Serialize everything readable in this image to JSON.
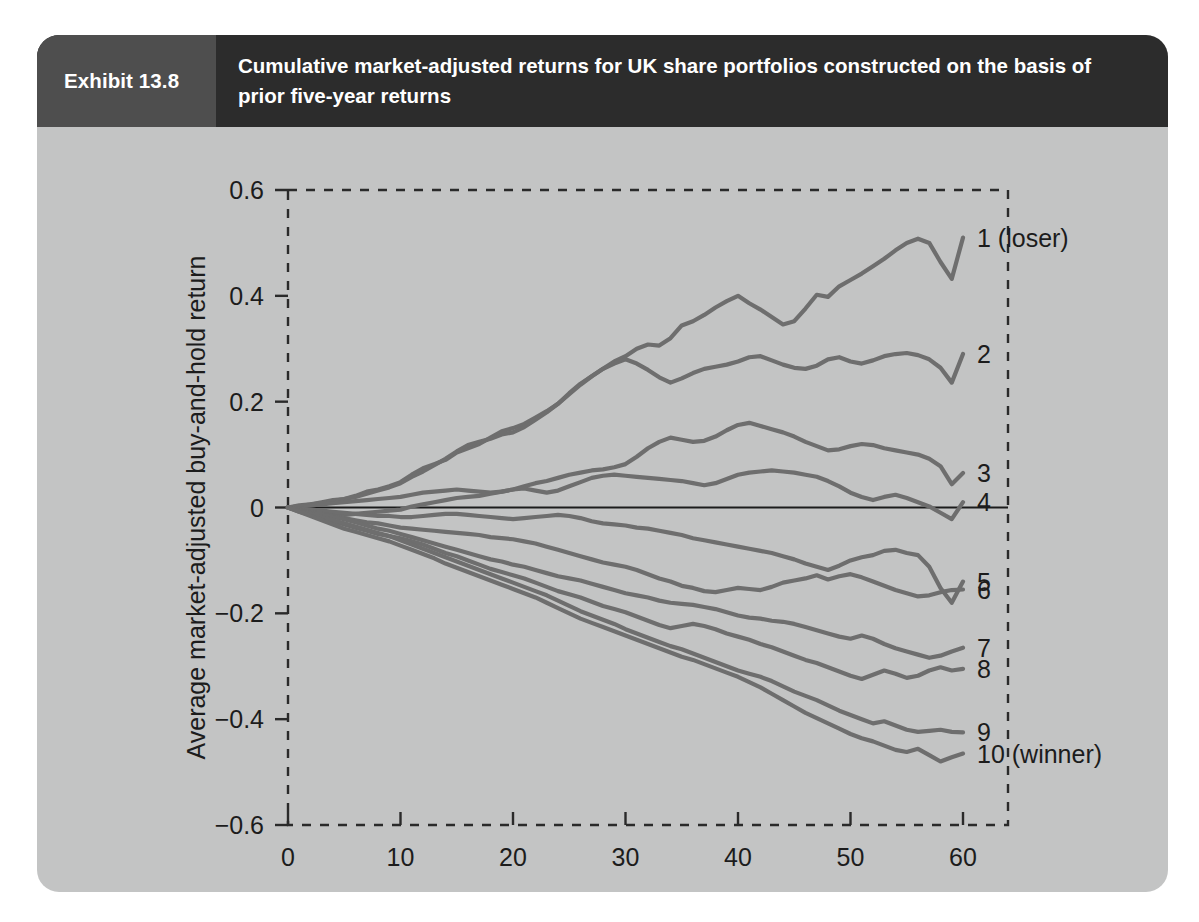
{
  "exhibit": {
    "tag": "Exhibit 13.8",
    "title": "Cumulative market-adjusted returns for UK share portfolios constructed on the basis of prior five-year returns"
  },
  "colors": {
    "card_background": "#c3c4c4",
    "header_title_background": "#2c2c2c",
    "header_tag_background": "#4e4e4e",
    "line_color": "#6e6e6e",
    "axis_color": "#2a2a2a",
    "text_color": "#1c1c1c"
  },
  "chart_data": {
    "type": "line",
    "title": "Cumulative market-adjusted returns for UK share portfolios constructed on the basis of prior five-year returns",
    "xlabel": "Months since portfolio formation",
    "ylabel": "Average market-adjusted buy-and-hold return",
    "xlim": [
      0,
      64
    ],
    "ylim": [
      -0.6,
      0.6
    ],
    "xticks": [
      0,
      10,
      20,
      30,
      40,
      50,
      60
    ],
    "xticklabels": [
      "0",
      "10",
      "20",
      "30",
      "40",
      "50",
      "60"
    ],
    "yticks": [
      -0.6,
      -0.4,
      -0.2,
      0,
      0.2,
      0.4,
      0.6
    ],
    "yticklabels": [
      "−0.6",
      "−0.4",
      "−0.2",
      "0",
      "0.2",
      "0.4",
      "0.6"
    ],
    "grid": false,
    "legend_position": "right-end-of-line",
    "zero_reference_line": 0,
    "x": [
      0,
      1,
      2,
      3,
      4,
      5,
      6,
      7,
      8,
      9,
      10,
      11,
      12,
      13,
      14,
      15,
      16,
      17,
      18,
      19,
      20,
      21,
      22,
      23,
      24,
      25,
      26,
      27,
      28,
      29,
      30,
      31,
      32,
      33,
      34,
      35,
      36,
      37,
      38,
      39,
      40,
      41,
      42,
      43,
      44,
      45,
      46,
      47,
      48,
      49,
      50,
      51,
      52,
      53,
      54,
      55,
      56,
      57,
      58,
      59,
      60
    ],
    "series": [
      {
        "name": "1 (loser)",
        "label": "1 (loser)",
        "final_value": 0.51,
        "values": [
          0,
          0.004,
          0.006,
          0.01,
          0.014,
          0.016,
          0.022,
          0.03,
          0.034,
          0.04,
          0.048,
          0.062,
          0.074,
          0.082,
          0.09,
          0.104,
          0.112,
          0.12,
          0.132,
          0.144,
          0.15,
          0.158,
          0.17,
          0.182,
          0.196,
          0.216,
          0.234,
          0.248,
          0.262,
          0.276,
          0.286,
          0.3,
          0.308,
          0.306,
          0.32,
          0.344,
          0.352,
          0.364,
          0.378,
          0.39,
          0.4,
          0.386,
          0.374,
          0.36,
          0.346,
          0.352,
          0.376,
          0.402,
          0.398,
          0.418,
          0.43,
          0.442,
          0.456,
          0.47,
          0.486,
          0.5,
          0.508,
          0.5,
          0.464,
          0.432,
          0.51
        ]
      },
      {
        "name": "2",
        "label": "2",
        "final_value": 0.29,
        "values": [
          0,
          0.002,
          0.006,
          0.008,
          0.012,
          0.016,
          0.02,
          0.026,
          0.032,
          0.038,
          0.046,
          0.058,
          0.068,
          0.08,
          0.092,
          0.106,
          0.118,
          0.124,
          0.13,
          0.138,
          0.142,
          0.152,
          0.166,
          0.18,
          0.196,
          0.214,
          0.232,
          0.248,
          0.262,
          0.272,
          0.28,
          0.272,
          0.26,
          0.246,
          0.236,
          0.244,
          0.254,
          0.262,
          0.266,
          0.27,
          0.276,
          0.284,
          0.286,
          0.278,
          0.27,
          0.264,
          0.262,
          0.268,
          0.28,
          0.284,
          0.276,
          0.272,
          0.278,
          0.286,
          0.29,
          0.292,
          0.288,
          0.28,
          0.264,
          0.236,
          0.29
        ]
      },
      {
        "name": "3",
        "label": "3",
        "final_value": 0.065,
        "values": [
          0,
          0.002,
          0.004,
          0.006,
          0.008,
          0.01,
          0.012,
          0.014,
          0.016,
          0.018,
          0.02,
          0.024,
          0.028,
          0.03,
          0.032,
          0.034,
          0.032,
          0.03,
          0.028,
          0.03,
          0.034,
          0.04,
          0.046,
          0.05,
          0.056,
          0.062,
          0.066,
          0.07,
          0.072,
          0.076,
          0.082,
          0.096,
          0.112,
          0.124,
          0.132,
          0.128,
          0.124,
          0.126,
          0.134,
          0.146,
          0.156,
          0.16,
          0.154,
          0.148,
          0.142,
          0.134,
          0.124,
          0.116,
          0.108,
          0.11,
          0.116,
          0.12,
          0.118,
          0.112,
          0.108,
          0.104,
          0.1,
          0.092,
          0.078,
          0.044,
          0.065
        ]
      },
      {
        "name": "4",
        "label": "4",
        "final_value": 0.01,
        "values": [
          0,
          -0.006,
          -0.01,
          -0.012,
          -0.014,
          -0.014,
          -0.012,
          -0.01,
          -0.008,
          -0.006,
          -0.004,
          0.002,
          0.006,
          0.01,
          0.014,
          0.018,
          0.02,
          0.022,
          0.026,
          0.03,
          0.034,
          0.036,
          0.032,
          0.028,
          0.032,
          0.04,
          0.048,
          0.056,
          0.06,
          0.062,
          0.06,
          0.058,
          0.056,
          0.054,
          0.052,
          0.05,
          0.046,
          0.042,
          0.046,
          0.054,
          0.062,
          0.066,
          0.068,
          0.07,
          0.068,
          0.066,
          0.062,
          0.058,
          0.05,
          0.04,
          0.028,
          0.02,
          0.014,
          0.02,
          0.024,
          0.018,
          0.01,
          0.002,
          -0.01,
          -0.022,
          0.01
        ]
      },
      {
        "name": "5",
        "label": "5",
        "final_value": -0.14,
        "values": [
          0,
          -0.002,
          -0.004,
          -0.006,
          -0.008,
          -0.01,
          -0.012,
          -0.014,
          -0.016,
          -0.016,
          -0.018,
          -0.018,
          -0.016,
          -0.014,
          -0.012,
          -0.012,
          -0.014,
          -0.016,
          -0.018,
          -0.02,
          -0.022,
          -0.02,
          -0.018,
          -0.016,
          -0.014,
          -0.016,
          -0.02,
          -0.026,
          -0.03,
          -0.032,
          -0.034,
          -0.038,
          -0.04,
          -0.044,
          -0.048,
          -0.052,
          -0.058,
          -0.062,
          -0.066,
          -0.07,
          -0.074,
          -0.078,
          -0.082,
          -0.086,
          -0.092,
          -0.098,
          -0.106,
          -0.112,
          -0.118,
          -0.11,
          -0.1,
          -0.094,
          -0.09,
          -0.082,
          -0.08,
          -0.086,
          -0.09,
          -0.112,
          -0.152,
          -0.18,
          -0.14
        ]
      },
      {
        "name": "6",
        "label": "6",
        "final_value": -0.155,
        "values": [
          0,
          -0.004,
          -0.008,
          -0.012,
          -0.016,
          -0.02,
          -0.024,
          -0.028,
          -0.03,
          -0.034,
          -0.038,
          -0.04,
          -0.042,
          -0.044,
          -0.046,
          -0.048,
          -0.05,
          -0.052,
          -0.056,
          -0.058,
          -0.06,
          -0.064,
          -0.068,
          -0.074,
          -0.08,
          -0.086,
          -0.092,
          -0.098,
          -0.104,
          -0.108,
          -0.112,
          -0.118,
          -0.126,
          -0.134,
          -0.14,
          -0.148,
          -0.152,
          -0.158,
          -0.16,
          -0.156,
          -0.152,
          -0.154,
          -0.156,
          -0.15,
          -0.142,
          -0.138,
          -0.134,
          -0.128,
          -0.136,
          -0.13,
          -0.126,
          -0.132,
          -0.14,
          -0.148,
          -0.156,
          -0.162,
          -0.168,
          -0.166,
          -0.16,
          -0.156,
          -0.155
        ]
      },
      {
        "name": "7",
        "label": "7",
        "final_value": -0.265,
        "values": [
          0,
          -0.006,
          -0.01,
          -0.014,
          -0.018,
          -0.022,
          -0.028,
          -0.034,
          -0.04,
          -0.044,
          -0.05,
          -0.056,
          -0.062,
          -0.068,
          -0.074,
          -0.08,
          -0.086,
          -0.092,
          -0.098,
          -0.102,
          -0.108,
          -0.112,
          -0.118,
          -0.124,
          -0.13,
          -0.134,
          -0.138,
          -0.144,
          -0.15,
          -0.156,
          -0.162,
          -0.166,
          -0.17,
          -0.176,
          -0.18,
          -0.182,
          -0.184,
          -0.188,
          -0.192,
          -0.198,
          -0.204,
          -0.208,
          -0.21,
          -0.214,
          -0.216,
          -0.22,
          -0.226,
          -0.232,
          -0.238,
          -0.244,
          -0.248,
          -0.242,
          -0.248,
          -0.258,
          -0.266,
          -0.272,
          -0.278,
          -0.284,
          -0.28,
          -0.272,
          -0.265
        ]
      },
      {
        "name": "8",
        "label": "8",
        "final_value": -0.305,
        "values": [
          0,
          -0.008,
          -0.014,
          -0.02,
          -0.026,
          -0.032,
          -0.038,
          -0.044,
          -0.05,
          -0.054,
          -0.058,
          -0.064,
          -0.07,
          -0.078,
          -0.086,
          -0.092,
          -0.1,
          -0.108,
          -0.116,
          -0.122,
          -0.128,
          -0.134,
          -0.142,
          -0.15,
          -0.158,
          -0.164,
          -0.17,
          -0.178,
          -0.186,
          -0.192,
          -0.198,
          -0.206,
          -0.214,
          -0.222,
          -0.228,
          -0.224,
          -0.22,
          -0.224,
          -0.23,
          -0.238,
          -0.244,
          -0.25,
          -0.258,
          -0.264,
          -0.272,
          -0.28,
          -0.288,
          -0.294,
          -0.302,
          -0.31,
          -0.318,
          -0.324,
          -0.316,
          -0.308,
          -0.314,
          -0.322,
          -0.318,
          -0.308,
          -0.302,
          -0.308,
          -0.305
        ]
      },
      {
        "name": "9",
        "label": "9",
        "final_value": -0.425,
        "values": [
          0,
          -0.006,
          -0.012,
          -0.018,
          -0.024,
          -0.03,
          -0.036,
          -0.042,
          -0.048,
          -0.054,
          -0.062,
          -0.07,
          -0.078,
          -0.086,
          -0.094,
          -0.102,
          -0.11,
          -0.118,
          -0.126,
          -0.134,
          -0.142,
          -0.15,
          -0.158,
          -0.166,
          -0.176,
          -0.186,
          -0.196,
          -0.204,
          -0.212,
          -0.22,
          -0.23,
          -0.238,
          -0.246,
          -0.254,
          -0.262,
          -0.268,
          -0.276,
          -0.284,
          -0.292,
          -0.3,
          -0.308,
          -0.314,
          -0.32,
          -0.328,
          -0.338,
          -0.348,
          -0.356,
          -0.364,
          -0.374,
          -0.384,
          -0.392,
          -0.4,
          -0.408,
          -0.404,
          -0.412,
          -0.42,
          -0.424,
          -0.422,
          -0.42,
          -0.424,
          -0.425
        ]
      },
      {
        "name": "10 (winner)",
        "label": "10 (winner)",
        "final_value": -0.465,
        "values": [
          0,
          -0.008,
          -0.016,
          -0.024,
          -0.032,
          -0.04,
          -0.046,
          -0.052,
          -0.058,
          -0.064,
          -0.072,
          -0.08,
          -0.088,
          -0.096,
          -0.106,
          -0.114,
          -0.122,
          -0.13,
          -0.138,
          -0.146,
          -0.154,
          -0.162,
          -0.17,
          -0.18,
          -0.19,
          -0.2,
          -0.21,
          -0.218,
          -0.226,
          -0.234,
          -0.242,
          -0.25,
          -0.258,
          -0.266,
          -0.274,
          -0.282,
          -0.288,
          -0.296,
          -0.304,
          -0.312,
          -0.32,
          -0.33,
          -0.34,
          -0.352,
          -0.364,
          -0.376,
          -0.388,
          -0.398,
          -0.408,
          -0.418,
          -0.428,
          -0.436,
          -0.442,
          -0.45,
          -0.458,
          -0.462,
          -0.456,
          -0.468,
          -0.48,
          -0.472,
          -0.465
        ]
      }
    ]
  }
}
